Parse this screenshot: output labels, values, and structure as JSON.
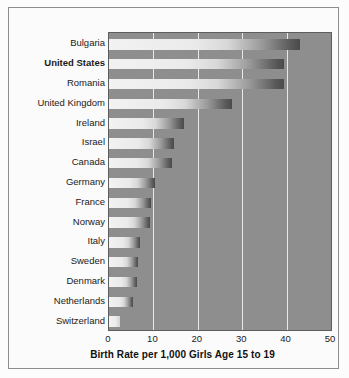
{
  "chart_data": {
    "type": "bar",
    "orientation": "horizontal",
    "title": "",
    "xlabel": "Birth Rate per 1,000 Girls Age 15 to 19",
    "ylabel": "",
    "xlim": [
      0,
      50
    ],
    "xticks": [
      "0",
      "10",
      "20",
      "30",
      "40",
      "50"
    ],
    "grid": "vertical",
    "legend": "none",
    "highlight_category": "United States",
    "categories": [
      "Bulgaria",
      "United States",
      "Romania",
      "United Kingdom",
      "Ireland",
      "Israel",
      "Canada",
      "Germany",
      "France",
      "Norway",
      "Italy",
      "Sweden",
      "Denmark",
      "Netherlands",
      "Switzerland"
    ],
    "values": [
      43,
      39.5,
      39.5,
      27.7,
      17,
      14.6,
      14.2,
      10.4,
      9.5,
      9.2,
      6.9,
      6.5,
      6.4,
      5.4,
      2.5
    ]
  },
  "colors": {
    "plot_background": "#8e8e8e",
    "gridline": "#e9e9e9",
    "bar_light": "#f2f2f2",
    "bar_dark": "#4a4a4a",
    "frame_border": "#8d8d8d",
    "page_background": "#fcfcfc",
    "text": "#1a1a1a"
  }
}
